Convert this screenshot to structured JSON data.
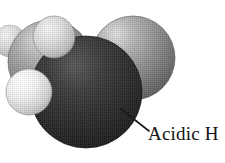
{
  "figure": {
    "name": "space-filling-molecular-model",
    "caption_label": "Acidic H",
    "background_color": "#ffffff",
    "width": 225,
    "height": 163
  },
  "annotation": {
    "label": "Acidic H",
    "leader_line": {
      "from_x": 121,
      "from_y": 109,
      "to_x": 148,
      "to_y": 131,
      "color": "#1a1a1a",
      "width": 1.6
    }
  },
  "molecule": {
    "style": "space-filling",
    "rendering": "grayscale halftone",
    "atoms": [
      {
        "id": "h-far-left",
        "element_label": "H",
        "shade": "light",
        "color": "#e3e3e3",
        "cx": 10,
        "cy": 41,
        "r": 16,
        "z": 1
      },
      {
        "id": "c-left",
        "element_label": "C",
        "shade": "medium",
        "color": "#8e8e8e",
        "cx": 50,
        "cy": 62,
        "r": 42,
        "z": 2
      },
      {
        "id": "c-right",
        "element_label": "C",
        "shade": "medium",
        "color": "#8e8e8e",
        "cx": 133,
        "cy": 58,
        "r": 42,
        "z": 2
      },
      {
        "id": "h-top-left",
        "element_label": "H",
        "shade": "light",
        "color": "#d8d8d8",
        "cx": 54,
        "cy": 37,
        "r": 21,
        "z": 4
      },
      {
        "id": "h-lower-left",
        "element_label": "H",
        "shade": "light",
        "color": "#ececec",
        "cx": 29,
        "cy": 92,
        "r": 23,
        "z": 4
      },
      {
        "id": "o-center",
        "element_label": "O",
        "shade": "dark",
        "color": "#2b2b2b",
        "cx": 86,
        "cy": 92,
        "r": 56,
        "z": 3
      },
      {
        "id": "h-acidic",
        "element_label": "H",
        "shade": "light",
        "color": "#cfcfcf",
        "cx": 121,
        "cy": 107,
        "r": 17,
        "z": 5,
        "annotated_as": "Acidic H"
      }
    ]
  }
}
